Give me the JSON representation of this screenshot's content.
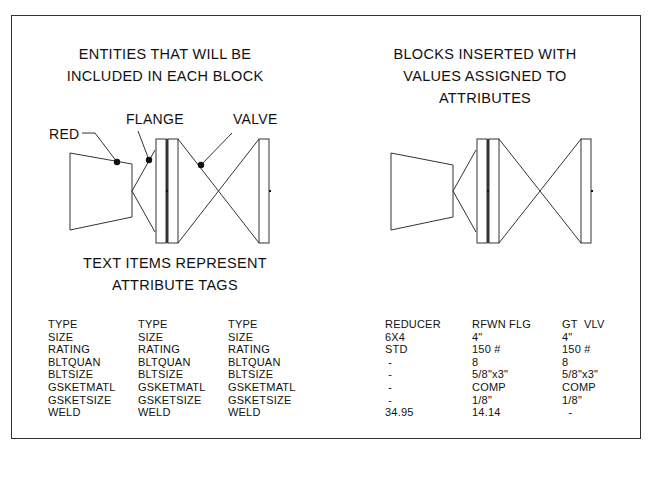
{
  "left_title": "ENTITIES THAT WILL BE\nINCLUDED IN EACH BLOCK",
  "right_title": "BLOCKS INSERTED WITH\nVALUES ASSIGNED TO\nATTRIBUTES",
  "left_caption": "TEXT ITEMS REPRESENT\nATTRIBUTE TAGS",
  "callouts": {
    "red": "RED",
    "flange": "FLANGE",
    "valve": "VALVE"
  },
  "tag_columns": [
    [
      "TYPE",
      "SIZE",
      "RATING",
      "BLTQUAN",
      "BLTSIZE",
      "GSKETMATL",
      "GSKETSIZE",
      "WELD"
    ],
    [
      "TYPE",
      "SIZE",
      "RATING",
      "BLTQUAN",
      "BLTSIZE",
      "GSKETMATL",
      "GSKETSIZE",
      "WELD"
    ],
    [
      "TYPE",
      "SIZE",
      "RATING",
      "BLTQUAN",
      "BLTSIZE",
      "GSKETMATL",
      "GSKETSIZE",
      "WELD"
    ]
  ],
  "value_columns": [
    [
      "REDUCER",
      "6X4",
      "STD",
      " -",
      " -",
      " -",
      " -",
      "34.95"
    ],
    [
      "RFWN FLG",
      "4\"",
      "150 #",
      "8",
      "5/8\"x3\"",
      "COMP",
      "1/8\"",
      "14.14"
    ],
    [
      "GT  VLV",
      "4\"",
      "150 #",
      "8",
      "5/8\"x3\"",
      "COMP",
      "1/8\"",
      "  -"
    ]
  ]
}
